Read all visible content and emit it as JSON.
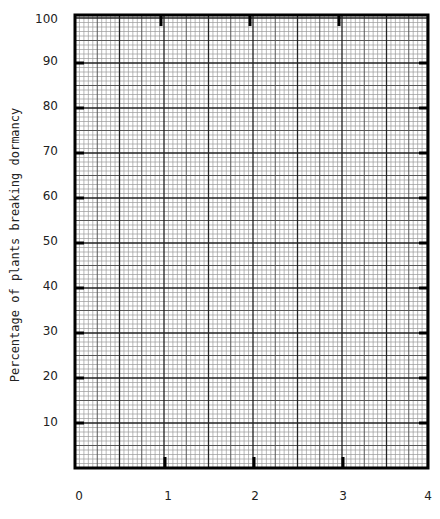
{
  "chart_data": {
    "type": "line",
    "title": "",
    "xlabel": "",
    "ylabel": "Percentage of plants breaking dormancy",
    "x_ticks": [
      "0",
      "1",
      "2",
      "3",
      "4"
    ],
    "y_ticks": [
      "10",
      "20",
      "30",
      "40",
      "50",
      "60",
      "70",
      "80",
      "90",
      "100"
    ],
    "xlim": [
      0,
      4
    ],
    "ylim": [
      0,
      100
    ],
    "grid": true,
    "grid_style": "graph paper: minor lines every 1 unit (y) / 0.05 (x), medium every 5 minor, major every 10 minor",
    "series": [],
    "legend": null,
    "note": "Blank graph paper with axes; no data plotted"
  },
  "colors": {
    "background": "#ffffff",
    "minor_grid": "#9a9a9a",
    "medium_grid": "#555555",
    "major_grid": "#222222",
    "frame": "#000000"
  }
}
